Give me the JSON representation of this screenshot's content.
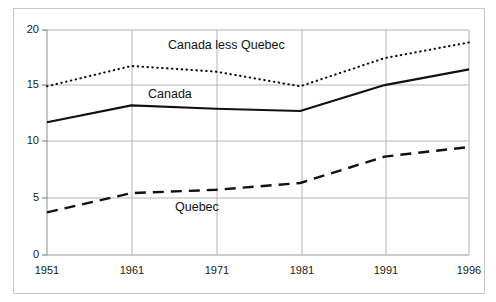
{
  "chart_data": {
    "type": "line",
    "title": "",
    "subtitle": "",
    "xlabel": "",
    "ylabel": "",
    "x": [
      1951,
      1961,
      1971,
      1981,
      1991,
      1996
    ],
    "xtick_labels": [
      "1951",
      "1961",
      "1971",
      "1981",
      "1991",
      "1996"
    ],
    "ytick_labels": [
      "0",
      "5",
      "10",
      "15",
      "20"
    ],
    "yticks": [
      0,
      5,
      10,
      15,
      20
    ],
    "ylim": [
      0,
      20
    ],
    "xlim": [
      1951,
      1996
    ],
    "grid": true,
    "grid_color": "#b0b0b0",
    "legend_position": "inline-annotations",
    "series": [
      {
        "name": "Canada less Quebec",
        "style": "dotted",
        "color": "#111111",
        "values": [
          15.0,
          16.8,
          16.3,
          15.0,
          17.5,
          18.9
        ],
        "label_x": 1971,
        "label_y": 18.6
      },
      {
        "name": "Canada",
        "style": "solid",
        "color": "#111111",
        "values": [
          11.8,
          13.3,
          13.0,
          12.8,
          15.1,
          16.5
        ],
        "label_x": 1966,
        "label_y": 14.2
      },
      {
        "name": "Quebec",
        "style": "dashed",
        "color": "#111111",
        "values": [
          3.8,
          5.5,
          5.8,
          6.4,
          8.75,
          9.6
        ],
        "label_x": 1975,
        "label_y": 3.4
      }
    ]
  },
  "annotations": {
    "canada_less_quebec": "Canada less Quebec",
    "canada": "Canada",
    "quebec": "Quebec"
  },
  "axis": {
    "y_0": "0",
    "y_5": "5",
    "y_10": "10",
    "y_15": "15",
    "y_20": "20",
    "x_1951": "1951",
    "x_1961": "1961",
    "x_1971": "1971",
    "x_1981": "1981",
    "x_1991": "1991",
    "x_1996": "1996"
  }
}
